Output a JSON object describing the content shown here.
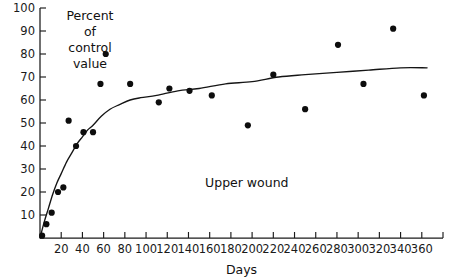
{
  "chart_data": {
    "type": "scatter",
    "title": "",
    "annotation": "Upper wound",
    "xlabel": "Days",
    "ylabel": "Percent of control value",
    "ylabel_lines": [
      "Percent",
      "of",
      "control",
      "value"
    ],
    "xlim": [
      0,
      380
    ],
    "ylim": [
      0,
      100
    ],
    "grid": false,
    "legend": "none",
    "xticks": [
      20,
      40,
      60,
      80,
      100,
      120,
      140,
      160,
      180,
      200,
      220,
      240,
      260,
      280,
      300,
      320,
      340,
      360
    ],
    "xtick_labels": [
      "20",
      "40",
      "60",
      "80",
      "100",
      "120",
      "140",
      "160",
      "180",
      "200",
      "220",
      "240",
      "260",
      "280",
      "300",
      "320",
      "340",
      "360"
    ],
    "yticks": [
      10,
      20,
      30,
      40,
      50,
      60,
      70,
      80,
      90,
      100
    ],
    "ytick_labels": [
      "10",
      "20",
      "30",
      "40",
      "50",
      "60",
      "70",
      "80",
      "90",
      "100"
    ],
    "points": [
      {
        "x": 2,
        "y": 1
      },
      {
        "x": 6,
        "y": 6
      },
      {
        "x": 11,
        "y": 11
      },
      {
        "x": 17,
        "y": 20
      },
      {
        "x": 22,
        "y": 22
      },
      {
        "x": 27,
        "y": 51
      },
      {
        "x": 34,
        "y": 40
      },
      {
        "x": 41,
        "y": 46
      },
      {
        "x": 50,
        "y": 46
      },
      {
        "x": 57,
        "y": 67
      },
      {
        "x": 62,
        "y": 80
      },
      {
        "x": 85,
        "y": 67
      },
      {
        "x": 112,
        "y": 59
      },
      {
        "x": 122,
        "y": 65
      },
      {
        "x": 141,
        "y": 64
      },
      {
        "x": 162,
        "y": 62
      },
      {
        "x": 196,
        "y": 49
      },
      {
        "x": 220,
        "y": 71
      },
      {
        "x": 250,
        "y": 56
      },
      {
        "x": 281,
        "y": 84
      },
      {
        "x": 305,
        "y": 67
      },
      {
        "x": 333,
        "y": 91
      },
      {
        "x": 362,
        "y": 62
      }
    ],
    "fit_curve": {
      "description": "monotonic saturating fit curve through scatter",
      "points": [
        {
          "x": 0,
          "y": 0
        },
        {
          "x": 4,
          "y": 7
        },
        {
          "x": 8,
          "y": 13
        },
        {
          "x": 12,
          "y": 19
        },
        {
          "x": 16,
          "y": 24
        },
        {
          "x": 20,
          "y": 28
        },
        {
          "x": 25,
          "y": 33
        },
        {
          "x": 30,
          "y": 37
        },
        {
          "x": 35,
          "y": 41
        },
        {
          "x": 40,
          "y": 44
        },
        {
          "x": 45,
          "y": 47
        },
        {
          "x": 50,
          "y": 49
        },
        {
          "x": 58,
          "y": 53
        },
        {
          "x": 66,
          "y": 56
        },
        {
          "x": 75,
          "y": 58
        },
        {
          "x": 85,
          "y": 60
        },
        {
          "x": 95,
          "y": 61
        },
        {
          "x": 110,
          "y": 62
        },
        {
          "x": 130,
          "y": 64
        },
        {
          "x": 150,
          "y": 65
        },
        {
          "x": 175,
          "y": 67
        },
        {
          "x": 200,
          "y": 68
        },
        {
          "x": 225,
          "y": 70
        },
        {
          "x": 250,
          "y": 71
        },
        {
          "x": 280,
          "y": 72
        },
        {
          "x": 310,
          "y": 73
        },
        {
          "x": 340,
          "y": 74
        },
        {
          "x": 365,
          "y": 74
        }
      ]
    }
  }
}
